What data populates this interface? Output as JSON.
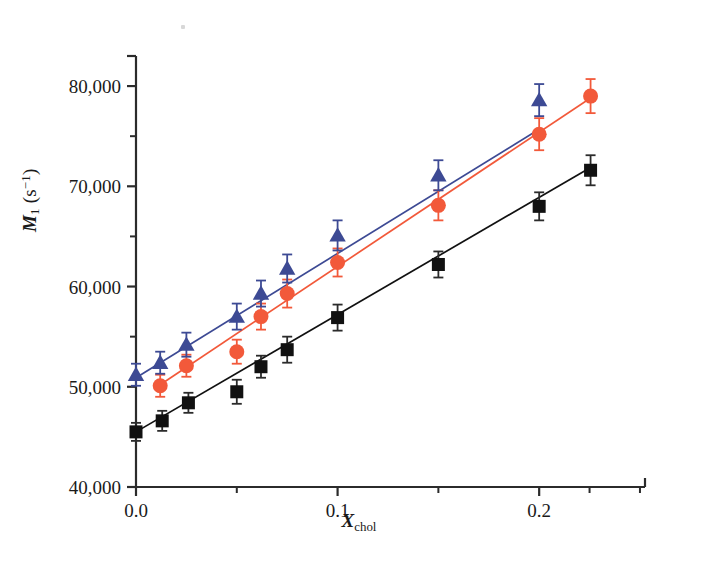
{
  "figure": {
    "type": "scatter-with-fit",
    "background": "#ffffff",
    "artifact_note": "small grey speck near top-left of plot area"
  },
  "axes": {
    "y": {
      "label_prefix": "M",
      "label_sub": "1",
      "label_unit_open": " (s",
      "label_unit_sup": "−1",
      "label_unit_close": ")",
      "tick_labels": [
        "40,000",
        "50,000",
        "60,000",
        "70,000",
        "80,000"
      ],
      "tick_values": [
        40000,
        50000,
        60000,
        70000,
        80000
      ],
      "minor_tick_values": [
        45000,
        55000,
        65000,
        75000
      ],
      "min": 40000,
      "max": 83000
    },
    "x": {
      "label_prefix": "X",
      "label_sub": "chol",
      "tick_labels": [
        "0.0",
        "0.1",
        "0.2"
      ],
      "tick_values": [
        0.0,
        0.1,
        0.2
      ],
      "minor_tick_values": [
        0.05,
        0.15,
        0.225,
        0.25
      ],
      "min": 0.0,
      "max": 0.2525
    }
  },
  "colors": {
    "black_series": "#111111",
    "red_series": "#f2593a",
    "blue_series": "#3d4a94",
    "axis": "#2b2b2b",
    "text": "#1a1a1a"
  },
  "chart_data": {
    "type": "scatter",
    "title": "",
    "xlabel": "X_chol",
    "ylabel": "M_1 (s^-1)",
    "xlim": [
      0.0,
      0.2525
    ],
    "ylim": [
      40000,
      83000
    ],
    "grid": false,
    "legend": "none",
    "series": [
      {
        "name": "black-squares",
        "marker": "square",
        "color": "#111111",
        "fit_line": {
          "intercept": 45500,
          "slope": 117000
        },
        "x": [
          0.0,
          0.013,
          0.026,
          0.05,
          0.062,
          0.075,
          0.1,
          0.15,
          0.2,
          0.2255
        ],
        "y": [
          45500,
          46600,
          48400,
          49500,
          52000,
          53700,
          56900,
          62200,
          68000,
          71600
        ],
        "yerr": [
          900,
          1000,
          1000,
          1200,
          1100,
          1300,
          1300,
          1300,
          1400,
          1500
        ]
      },
      {
        "name": "red-circles",
        "marker": "circle",
        "color": "#f2593a",
        "fit_line": {
          "intercept": 48600,
          "slope": 134000
        },
        "x": [
          0.012,
          0.025,
          0.05,
          0.062,
          0.075,
          0.1,
          0.15,
          0.2,
          0.2255
        ],
        "y": [
          50100,
          52100,
          53500,
          57000,
          59300,
          62400,
          68100,
          75200,
          79000
        ],
        "yerr": [
          1100,
          1100,
          1200,
          1300,
          1400,
          1400,
          1500,
          1600,
          1700
        ]
      },
      {
        "name": "blue-triangles",
        "marker": "triangle",
        "color": "#3d4a94",
        "fit_line": {
          "intercept": 50900,
          "slope": 124000
        },
        "x": [
          0.0,
          0.012,
          0.025,
          0.05,
          0.062,
          0.075,
          0.1,
          0.15,
          0.2
        ],
        "y": [
          51200,
          52400,
          54200,
          57000,
          59300,
          61800,
          65100,
          71100,
          78600
        ],
        "yerr": [
          1100,
          1100,
          1200,
          1300,
          1300,
          1400,
          1500,
          1500,
          1600
        ]
      }
    ]
  }
}
